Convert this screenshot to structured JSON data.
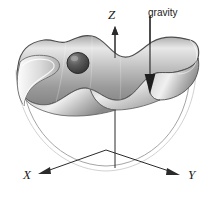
{
  "figure": {
    "name": "ball-on-wavy-surface-in-bowl",
    "background_color": "#ffffff",
    "line_color": "#1a1a1a",
    "surface_light": "#f2f2f2",
    "surface_mid": "#c9c9c9",
    "surface_dark": "#8d8d8d",
    "ball_color": "#4a4a4a"
  },
  "labels": {
    "z_axis": "Z",
    "gravity": "gravity",
    "x_axis": "X",
    "y_axis": "Y"
  },
  "icons": {
    "z_arrow": "arrow-up-icon",
    "gravity_arrow": "arrow-down-icon",
    "x_arrow": "arrow-left-icon",
    "y_arrow": "arrow-right-icon"
  },
  "elements": {
    "ball": "ball",
    "wavy_surface": "wavy-surface",
    "bowl": "bowl-outline"
  }
}
